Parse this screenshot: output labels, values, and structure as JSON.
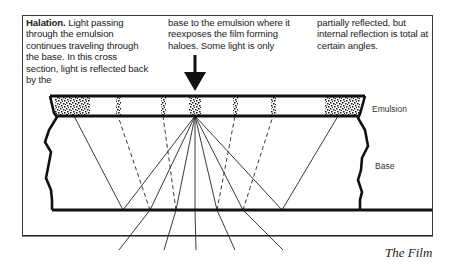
{
  "caption": {
    "title": "Halation.",
    "col1": "Light passing through the emulsion continues traveling through the base. In this cross section, light is reflected back by the",
    "col2": "base to the emulsion where it reexposes the film forming haloes. Some light is only",
    "col3": "partially reflected, but internal reflection is total at certain angles."
  },
  "labels": {
    "emulsion": "Emulsion",
    "base": "Base"
  },
  "footer": "The Film"
}
